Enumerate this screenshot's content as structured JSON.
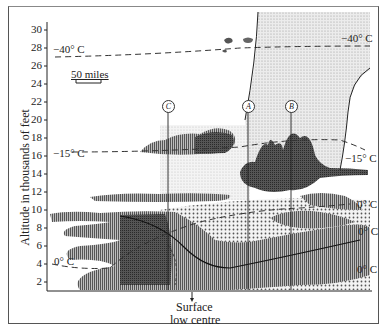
{
  "diagram": {
    "y_axis": {
      "label": "Altitude in thousands of feet",
      "ticks": [
        "30",
        "28",
        "26",
        "24",
        "22",
        "20",
        "18",
        "16",
        "14",
        "12",
        "10",
        "8",
        "6",
        "4",
        "2"
      ]
    },
    "scale_bar": "50 miles",
    "isotherms": {
      "minus40_left": "−40° C",
      "minus40_right": "−40° C",
      "minus15_left": "−15° C",
      "minus15_right": "−15° C",
      "zero_left": "0° C",
      "zero_right_1": "0° C",
      "zero_right_2": "0° C",
      "zero_right_3": "0° C"
    },
    "markers": [
      {
        "id": "C"
      },
      {
        "id": "A"
      },
      {
        "id": "B"
      }
    ],
    "annotation": {
      "line1": "Surface",
      "line2": "low centre"
    },
    "colors": {
      "ink": "#222222",
      "stipple": "#c8c8c8",
      "cloud_dark": "#4a4a4a",
      "cloud_mid": "#8a8a8a"
    }
  }
}
